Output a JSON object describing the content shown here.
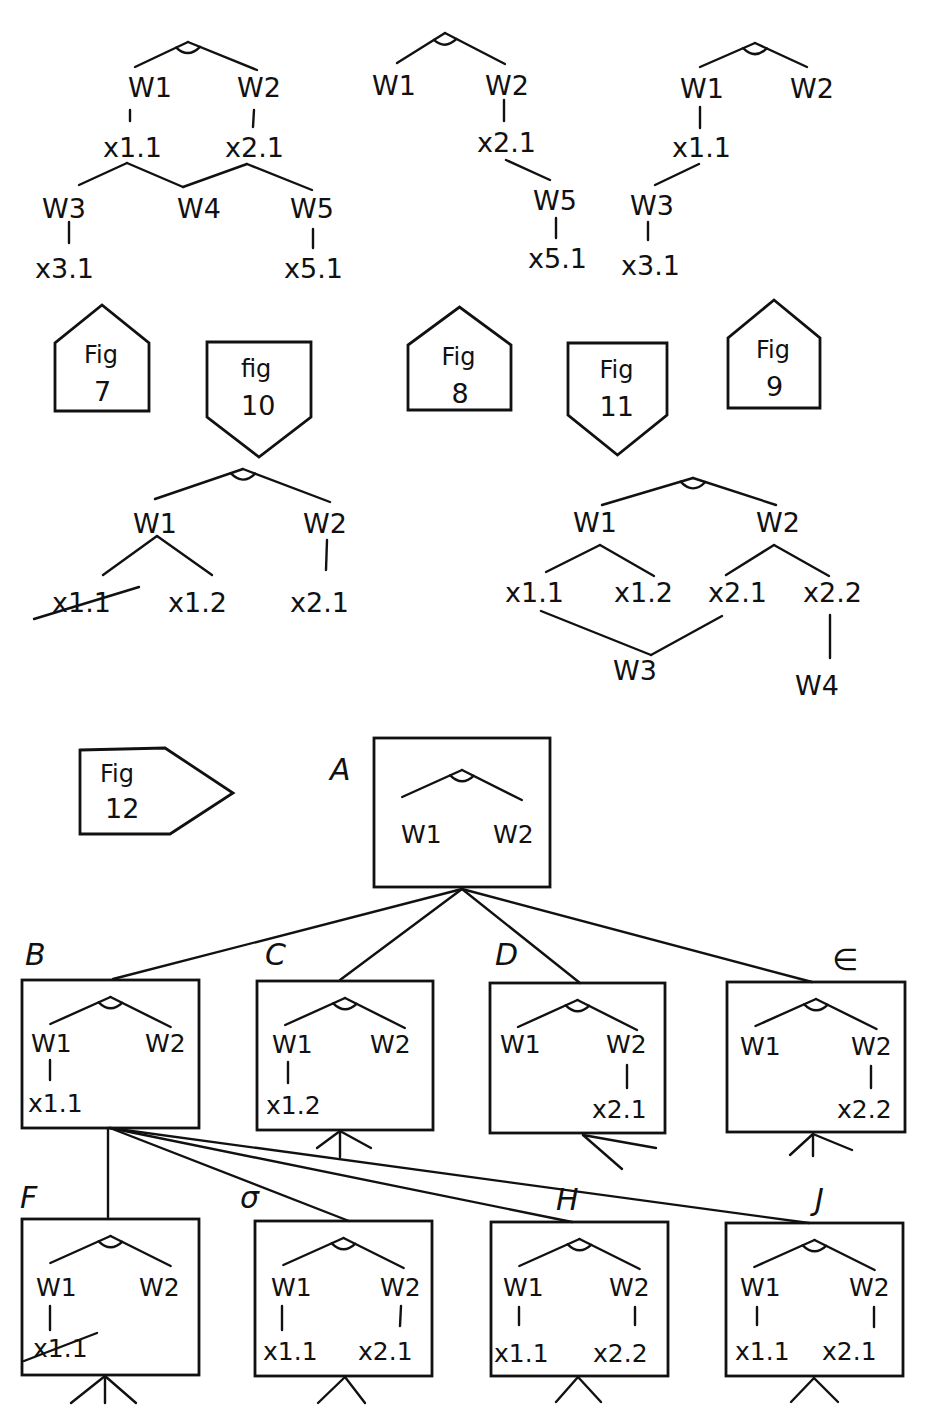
{
  "header": {
    "left_fragment": "",
    "center_fragment": ""
  },
  "colors": {
    "ink": "#111111",
    "paper": "#ffffff"
  },
  "top_trees": [
    {
      "id": "tree-fig7",
      "and_arc": {
        "apex": [
          188,
          42
        ],
        "left": [
          135,
          67
        ],
        "right": [
          257,
          70
        ]
      },
      "nodes": [
        {
          "id": "w1",
          "text": "W1",
          "x": 128,
          "y": 97
        },
        {
          "id": "w2",
          "text": "W2",
          "x": 237,
          "y": 97
        },
        {
          "id": "x11",
          "text": "x1.1",
          "x": 103,
          "y": 157
        },
        {
          "id": "x21",
          "text": "x2.1",
          "x": 225,
          "y": 157
        },
        {
          "id": "w3",
          "text": "W3",
          "x": 42,
          "y": 218
        },
        {
          "id": "w4",
          "text": "W4",
          "x": 177,
          "y": 218
        },
        {
          "id": "w5",
          "text": "W5",
          "x": 290,
          "y": 218
        },
        {
          "id": "x31",
          "text": "x3.1",
          "x": 35,
          "y": 278
        },
        {
          "id": "x51",
          "text": "x5.1",
          "x": 284,
          "y": 278
        }
      ],
      "edges": [
        [
          130,
          110,
          130,
          121
        ],
        [
          254,
          110,
          253,
          127
        ],
        [
          127,
          163,
          79,
          185
        ],
        [
          127,
          163,
          183,
          187
        ],
        [
          183,
          187,
          247,
          164
        ],
        [
          247,
          164,
          312,
          190
        ],
        [
          69,
          222,
          69,
          243
        ],
        [
          313,
          229,
          313,
          248
        ]
      ]
    },
    {
      "id": "tree-fig8",
      "and_arc": {
        "apex": [
          445,
          33
        ],
        "left": [
          397,
          63
        ],
        "right": [
          505,
          64
        ]
      },
      "nodes": [
        {
          "id": "w1",
          "text": "W1",
          "x": 372,
          "y": 95
        },
        {
          "id": "w2",
          "text": "W2",
          "x": 485,
          "y": 95
        },
        {
          "id": "x21",
          "text": "x2.1",
          "x": 477,
          "y": 152
        },
        {
          "id": "w5",
          "text": "W5",
          "x": 533,
          "y": 210
        },
        {
          "id": "x51",
          "text": "x5.1",
          "x": 528,
          "y": 268
        }
      ],
      "edges": [
        [
          504,
          100,
          504,
          121
        ],
        [
          506,
          160,
          550,
          180
        ],
        [
          556,
          218,
          556,
          238
        ]
      ]
    },
    {
      "id": "tree-fig9",
      "and_arc": {
        "apex": [
          755,
          43
        ],
        "left": [
          700,
          67
        ],
        "right": [
          807,
          67
        ]
      },
      "nodes": [
        {
          "id": "w1",
          "text": "W1",
          "x": 680,
          "y": 98
        },
        {
          "id": "w2",
          "text": "W2",
          "x": 790,
          "y": 98
        },
        {
          "id": "x11",
          "text": "x1.1",
          "x": 672,
          "y": 157
        },
        {
          "id": "w3",
          "text": "W3",
          "x": 630,
          "y": 215
        },
        {
          "id": "x31",
          "text": "x3.1",
          "x": 621,
          "y": 275
        }
      ],
      "edges": [
        [
          700,
          107,
          700,
          128
        ],
        [
          699,
          164,
          655,
          185
        ],
        [
          648,
          222,
          648,
          240
        ]
      ]
    }
  ],
  "fig_tags": [
    {
      "id": "fig7",
      "line1": "Fig",
      "line2": "7",
      "shape": "up",
      "x": 30,
      "y": 305,
      "w": 50,
      "h": 106
    },
    {
      "id": "fig10",
      "line1": "fig",
      "line2": "10",
      "shape": "down",
      "x": 116,
      "y": 342,
      "w": 60,
      "h": 115
    },
    {
      "id": "fig8",
      "line1": "Fig",
      "line2": "8",
      "shape": "up",
      "x": 229,
      "y": 307,
      "w": 55,
      "h": 103
    },
    {
      "id": "fig11",
      "line1": "Fig",
      "line2": "11",
      "shape": "down",
      "x": 318,
      "y": 343,
      "w": 55,
      "h": 112
    },
    {
      "id": "fig9",
      "line1": "Fig",
      "line2": "9",
      "shape": "up",
      "x": 409,
      "y": 300,
      "w": 52,
      "h": 108
    }
  ],
  "mid_trees": [
    {
      "id": "tree-fig10",
      "and_arc": {
        "apex": [
          243,
          469
        ],
        "left": [
          155,
          499
        ],
        "right": [
          330,
          502
        ]
      },
      "nodes": [
        {
          "id": "w1",
          "text": "W1",
          "x": 133,
          "y": 533
        },
        {
          "id": "w2",
          "text": "W2",
          "x": 303,
          "y": 533
        },
        {
          "id": "x11",
          "text": "x1.1",
          "x": 52,
          "y": 612,
          "struck": true
        },
        {
          "id": "x12",
          "text": "x1.2",
          "x": 168,
          "y": 612
        },
        {
          "id": "x21",
          "text": "x2.1",
          "x": 290,
          "y": 612
        }
      ],
      "edges": [
        [
          157,
          536,
          103,
          575
        ],
        [
          157,
          536,
          212,
          575
        ],
        [
          327,
          540,
          326,
          570
        ]
      ],
      "strike": [
        34,
        619,
        139,
        587
      ]
    },
    {
      "id": "tree-fig11",
      "and_arc": {
        "apex": [
          693,
          478
        ],
        "left": [
          602,
          505
        ],
        "right": [
          776,
          505
        ]
      },
      "nodes": [
        {
          "id": "w1",
          "text": "W1",
          "x": 573,
          "y": 532
        },
        {
          "id": "w2",
          "text": "W2",
          "x": 756,
          "y": 532
        },
        {
          "id": "x11",
          "text": "x1.1",
          "x": 505,
          "y": 602
        },
        {
          "id": "x12",
          "text": "x1.2",
          "x": 614,
          "y": 602
        },
        {
          "id": "x21",
          "text": "x2.1",
          "x": 708,
          "y": 602
        },
        {
          "id": "x22",
          "text": "x2.2",
          "x": 803,
          "y": 602
        },
        {
          "id": "w3",
          "text": "W3",
          "x": 613,
          "y": 680
        },
        {
          "id": "w4",
          "text": "W4",
          "x": 795,
          "y": 695
        }
      ],
      "edges": [
        [
          600,
          545,
          546,
          572
        ],
        [
          600,
          545,
          654,
          576
        ],
        [
          774,
          545,
          726,
          575
        ],
        [
          774,
          545,
          829,
          576
        ],
        [
          541,
          611,
          651,
          655
        ],
        [
          651,
          655,
          722,
          616
        ],
        [
          830,
          615,
          830,
          658
        ]
      ]
    }
  ],
  "fig12": {
    "tag": {
      "line1": "Fig",
      "line2": "12",
      "x": 70,
      "y": 746
    },
    "nodes": [
      {
        "id": "A",
        "letter": "A",
        "letter_x": 330,
        "letter_y": 780,
        "box": [
          374,
          738,
          550,
          887
        ],
        "and_arc": {
          "apex": [
            410,
            763
          ],
          "left": [
            355,
            785
          ],
          "right": [
            460,
            790
          ]
        },
        "w1": {
          "text": "W1",
          "x": 401,
          "y": 843
        },
        "w2": {
          "text": "W2",
          "x": 493,
          "y": 843
        },
        "branches": []
      },
      {
        "id": "B",
        "letter": "B",
        "letter_x": 25,
        "letter_y": 965,
        "box": [
          22,
          980,
          199,
          1128
        ],
        "and_arc": {
          "apex": [
            113,
            995
          ],
          "left": [
            49,
            1022
          ],
          "right": [
            170,
            1025
          ]
        },
        "w1": {
          "text": "W1",
          "x": 31,
          "y": 1052
        },
        "w2": {
          "text": "W2",
          "x": 145,
          "y": 1052
        },
        "branches": [
          {
            "side": "left",
            "text": "x1.1",
            "x": 28,
            "y": 1112,
            "line": [
              50,
              1060,
              50,
              1080
            ]
          }
        ]
      },
      {
        "id": "C",
        "letter": "C",
        "letter_x": 265,
        "letter_y": 965,
        "box": [
          257,
          981,
          433,
          1130
        ],
        "and_arc": {
          "apex": [
            348,
            996
          ],
          "left": [
            288,
            1024
          ],
          "right": [
            402,
            1027
          ]
        },
        "w1": {
          "text": "W1",
          "x": 272,
          "y": 1053
        },
        "w2": {
          "text": "W2",
          "x": 370,
          "y": 1053
        },
        "branches": [
          {
            "side": "left",
            "text": "x1.2",
            "x": 266,
            "y": 1114,
            "line": [
              288,
              1062,
              288,
              1083
            ]
          }
        ]
      },
      {
        "id": "D",
        "letter": "D",
        "letter_x": 495,
        "letter_y": 965,
        "box": [
          490,
          983,
          665,
          1133
        ],
        "and_arc": {
          "apex": [
            580,
            998
          ],
          "left": [
            520,
            1028
          ],
          "right": [
            645,
            1027
          ]
        },
        "w1": {
          "text": "W1",
          "x": 500,
          "y": 1053
        },
        "w2": {
          "text": "W2",
          "x": 606,
          "y": 1053
        },
        "branches": [
          {
            "side": "right",
            "text": "x2.1",
            "x": 592,
            "y": 1118,
            "line": [
              627,
              1065,
              627,
              1088
            ]
          }
        ]
      },
      {
        "id": "E",
        "letter": "∈",
        "letter_x": 832,
        "letter_y": 970,
        "box": [
          727,
          982,
          905,
          1132
        ],
        "and_arc": {
          "apex": [
            818,
            997
          ],
          "left": [
            757,
            1030
          ],
          "right": [
            882,
            1030
          ]
        },
        "w1": {
          "text": "W1",
          "x": 740,
          "y": 1055
        },
        "w2": {
          "text": "W2",
          "x": 851,
          "y": 1055
        },
        "branches": [
          {
            "side": "right",
            "text": "x2.2",
            "x": 837,
            "y": 1118,
            "line": [
              871,
              1066,
              871,
              1088
            ]
          }
        ]
      },
      {
        "id": "F",
        "letter": "F",
        "letter_x": 20,
        "letter_y": 1208,
        "box": [
          22,
          1219,
          199,
          1375
        ],
        "and_arc": {
          "apex": [
            105,
            1237
          ],
          "left": [
            50,
            1265
          ],
          "right": [
            160,
            1267
          ]
        },
        "w1": {
          "text": "W1",
          "x": 36,
          "y": 1296
        },
        "w2": {
          "text": "W2",
          "x": 139,
          "y": 1296
        },
        "branches": [
          {
            "side": "left",
            "text": "x1.1",
            "x": 33,
            "y": 1357,
            "line": [
              50,
              1306,
              50,
              1330
            ],
            "struck": true
          }
        ]
      },
      {
        "id": "G",
        "letter": "σ",
        "letter_x": 240,
        "letter_y": 1208,
        "box": [
          255,
          1221,
          432,
          1376
        ],
        "and_arc": {
          "apex": [
            345,
            1238
          ],
          "left": [
            293,
            1267
          ],
          "right": [
            400,
            1269
          ]
        },
        "w1": {
          "text": "W1",
          "x": 271,
          "y": 1296
        },
        "w2": {
          "text": "W2",
          "x": 380,
          "y": 1296
        },
        "branches": [
          {
            "side": "left",
            "text": "x1.1",
            "x": 263,
            "y": 1360,
            "line": [
              282,
              1306,
              282,
              1330
            ]
          },
          {
            "side": "right",
            "text": "x2.1",
            "x": 358,
            "y": 1360,
            "line": [
              401,
              1306,
              400,
              1326
            ]
          }
        ]
      },
      {
        "id": "H",
        "letter": "H",
        "letter_x": 556,
        "letter_y": 1210,
        "box": [
          491,
          1222,
          668,
          1376
        ],
        "and_arc": {
          "apex": [
            577,
            1240
          ],
          "left": [
            525,
            1267
          ],
          "right": [
            637,
            1270
          ]
        },
        "w1": {
          "text": "W1",
          "x": 503,
          "y": 1296
        },
        "w2": {
          "text": "W2",
          "x": 609,
          "y": 1296
        },
        "branches": [
          {
            "side": "left",
            "text": "x1.1",
            "x": 494,
            "y": 1362,
            "line": [
              519,
              1307,
              519,
              1325
            ]
          },
          {
            "side": "right",
            "text": "x2.2",
            "x": 593,
            "y": 1362,
            "line": [
              635,
              1307,
              635,
              1325
            ]
          }
        ]
      },
      {
        "id": "J",
        "letter": "J",
        "letter_x": 815,
        "letter_y": 1210,
        "box": [
          726,
          1223,
          903,
          1376
        ],
        "and_arc": {
          "apex": [
            811,
            1239
          ],
          "left": [
            758,
            1269
          ],
          "right": [
            870,
            1269
          ]
        },
        "w1": {
          "text": "W1",
          "x": 740,
          "y": 1296
        },
        "w2": {
          "text": "W2",
          "x": 849,
          "y": 1296
        },
        "branches": [
          {
            "side": "left",
            "text": "x1.1",
            "x": 735,
            "y": 1360,
            "line": [
              757,
              1307,
              757,
              1325
            ]
          },
          {
            "side": "right",
            "text": "x2.1",
            "x": 822,
            "y": 1360,
            "line": [
              874,
              1307,
              874,
              1327
            ]
          }
        ]
      }
    ],
    "links": [
      [
        462,
        889,
        113,
        979
      ],
      [
        462,
        889,
        340,
        980
      ],
      [
        462,
        889,
        580,
        983
      ],
      [
        462,
        889,
        812,
        982
      ],
      [
        108,
        1128,
        108,
        1217
      ],
      [
        110,
        1128,
        349,
        1221
      ],
      [
        110,
        1128,
        572,
        1222
      ],
      [
        110,
        1128,
        809,
        1223
      ]
    ],
    "stubs": [
      {
        "under": "C",
        "lines": [
          [
            340,
            1131,
            340,
            1157
          ],
          [
            340,
            1131,
            317,
            1148
          ],
          [
            340,
            1131,
            371,
            1148
          ]
        ]
      },
      {
        "under": "D",
        "lines": [
          [
            583,
            1135,
            622,
            1169
          ],
          [
            583,
            1135,
            656,
            1148
          ]
        ]
      },
      {
        "under": "E",
        "lines": [
          [
            813,
            1134,
            813,
            1156
          ],
          [
            813,
            1134,
            790,
            1155
          ],
          [
            813,
            1134,
            852,
            1150
          ]
        ]
      },
      {
        "under": "F",
        "lines": [
          [
            105,
            1376,
            105,
            1403
          ],
          [
            105,
            1376,
            71,
            1403
          ],
          [
            105,
            1376,
            136,
            1403
          ]
        ]
      },
      {
        "under": "G",
        "lines": [
          [
            345,
            1377,
            318,
            1403
          ],
          [
            345,
            1377,
            365,
            1403
          ]
        ]
      },
      {
        "under": "H",
        "lines": [
          [
            578,
            1377,
            556,
            1402
          ],
          [
            578,
            1377,
            601,
            1402
          ]
        ]
      },
      {
        "under": "J",
        "lines": [
          [
            814,
            1378,
            791,
            1402
          ],
          [
            814,
            1378,
            838,
            1402
          ]
        ]
      }
    ]
  }
}
